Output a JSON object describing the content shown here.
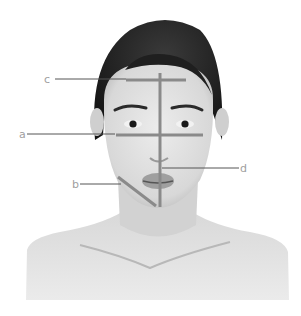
{
  "figure": {
    "colors": {
      "background": "#ffffff",
      "skin": "#e2e2e2",
      "skin_shadow": "#c8c8c8",
      "hair": "#1e1e1e",
      "guide_line": "#8a8a8a",
      "leader_line": "#555555",
      "label": "#a0a0a0"
    },
    "annotations": [
      {
        "id": "a",
        "label": "a",
        "label_pos": [
          19,
          138
        ],
        "leader": [
          [
            27,
            134
          ],
          [
            115,
            134
          ]
        ],
        "guide": [
          [
            116,
            135
          ],
          [
            203,
            135
          ]
        ]
      },
      {
        "id": "b",
        "label": "b",
        "label_pos": [
          72,
          188
        ],
        "leader": [
          [
            80,
            184
          ],
          [
            121,
            184
          ]
        ],
        "guide": [
          [
            118,
            177
          ],
          [
            156,
            206
          ]
        ]
      },
      {
        "id": "c",
        "label": "c",
        "label_pos": [
          44,
          83
        ],
        "leader": [
          [
            55,
            79
          ],
          [
            126,
            79
          ]
        ],
        "guide": [
          [
            126,
            80
          ],
          [
            186,
            80
          ]
        ]
      },
      {
        "id": "d",
        "label": "d",
        "label_pos": [
          240,
          172
        ],
        "leader": [
          [
            162,
            168
          ],
          [
            239,
            168
          ]
        ],
        "guide": [
          [
            160,
            73
          ],
          [
            160,
            207
          ]
        ]
      }
    ]
  }
}
